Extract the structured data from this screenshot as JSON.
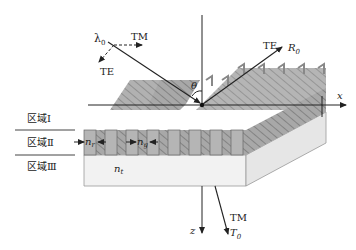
{
  "diagram": {
    "type": "subwavelength grating waveguide schematic",
    "incident": {
      "wavelength_label": "λ",
      "wavelength_sub": "0",
      "pol_tm": "TM",
      "pol_te": "TE"
    },
    "angle_label": "θ",
    "reflected": {
      "pol": "TE",
      "label": "R",
      "label_sub": "0"
    },
    "transmitted": {
      "pol": "TM",
      "label": "T",
      "label_sub": "0"
    },
    "axes": {
      "x": "x",
      "z": "z"
    },
    "regions": [
      {
        "name": "区域Ⅰ"
      },
      {
        "name": "区域Ⅱ"
      },
      {
        "name": "区域Ⅲ"
      }
    ],
    "indices": {
      "ridge": "n",
      "ridge_sub": "r",
      "groove": "n",
      "groove_sub": "g",
      "substrate": "n",
      "substrate_sub": "t"
    },
    "colors": {
      "grating": "#9a9a9a",
      "grating_front": "#b8b8b8",
      "substrate": "#eeeeee",
      "line": "#222222"
    }
  }
}
